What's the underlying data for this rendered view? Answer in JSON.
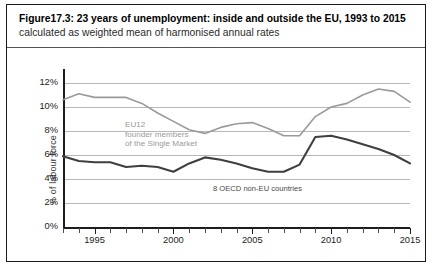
{
  "figure": {
    "caption_bold": "Figure17.3: 23 years of unemployment: inside and outside the EU, 1993 to 2015",
    "caption_rest": " calculated as weighted mean of harmonised annual rates"
  },
  "annotations": {
    "eu12": "EU12\nfounder members\nof the Single Market",
    "oecd": "8 OECD non-EU countries"
  },
  "colors": {
    "eu12_line": "#9a9a9a",
    "oecd_line": "#3f3f3f",
    "gridline": "#b7b7b7",
    "axis": "#1d1d1d",
    "frame": "#1a1a1a"
  },
  "chart_data": {
    "type": "line",
    "title": "Figure17.3: 23 years of unemployment: inside and outside the EU, 1993 to 2015",
    "subtitle": "calculated as weighted mean of harmonised annual rates",
    "xlabel": "",
    "ylabel": "% of labour force",
    "xlim": [
      1993,
      2015
    ],
    "ylim": [
      0,
      12
    ],
    "ytick_labels": [
      "0%",
      "2%",
      "4%",
      "6%",
      "8%",
      "10%",
      "12%"
    ],
    "ytick_values": [
      0,
      2,
      4,
      6,
      8,
      10,
      12
    ],
    "xtick_labels": [
      "1995",
      "2000",
      "2005",
      "2010",
      "2015"
    ],
    "xtick_values": [
      1995,
      2000,
      2005,
      2010,
      2015
    ],
    "x": [
      1993,
      1994,
      1995,
      1996,
      1997,
      1998,
      1999,
      2000,
      2001,
      2002,
      2003,
      2004,
      2005,
      2006,
      2007,
      2008,
      2009,
      2010,
      2011,
      2012,
      2013,
      2014,
      2015
    ],
    "grid": "horizontal",
    "legend": "in-plot annotations",
    "series": [
      {
        "name": "EU12 founder members of the Single Market",
        "color": "#9a9a9a",
        "values": [
          10.6,
          11.1,
          10.8,
          10.8,
          10.8,
          10.3,
          9.5,
          8.8,
          8.1,
          7.8,
          8.3,
          8.6,
          8.7,
          8.2,
          7.6,
          7.6,
          9.2,
          10.0,
          10.3,
          11.0,
          11.5,
          11.3,
          10.4
        ]
      },
      {
        "name": "8 OECD non-EU countries",
        "color": "#3f3f3f",
        "values": [
          5.9,
          5.5,
          5.4,
          5.4,
          5.0,
          5.1,
          5.0,
          4.6,
          5.3,
          5.8,
          5.6,
          5.3,
          4.9,
          4.6,
          4.6,
          5.2,
          7.5,
          7.6,
          7.3,
          6.9,
          6.5,
          6.0,
          5.3
        ]
      }
    ]
  },
  "bottom_sliver": ""
}
